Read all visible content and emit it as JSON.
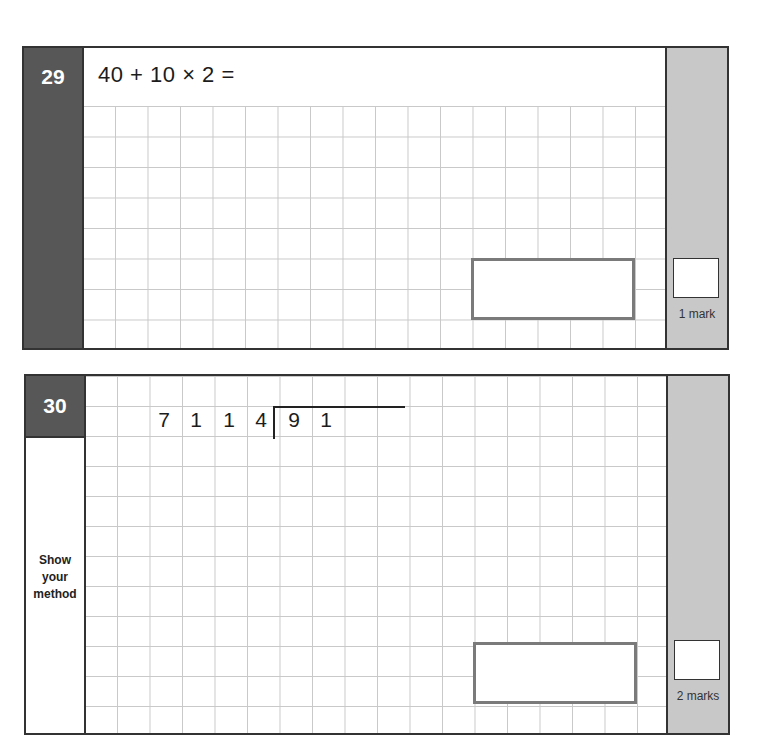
{
  "questions": [
    {
      "number": "29",
      "prompt": "40 + 10 × 2 =",
      "marks_label": "1 mark"
    },
    {
      "number": "30",
      "division": {
        "divisor": [
          "7",
          "1"
        ],
        "dividend": [
          "1",
          "4",
          "9",
          "1"
        ]
      },
      "side_label": [
        "Show",
        "your",
        "method"
      ],
      "marks_label": "2 marks"
    }
  ],
  "colors": {
    "question_number_bg": "#575757",
    "marks_column_bg": "#c8c8c8",
    "grid_line": "#c9c9c9",
    "answer_box_border": "#7a7a7a"
  }
}
